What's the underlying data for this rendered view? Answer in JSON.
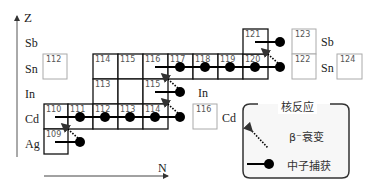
{
  "axes": {
    "z_label": "Z",
    "n_label": "N"
  },
  "elements_left": [
    {
      "symbol": "Sb",
      "row": "Sb"
    },
    {
      "symbol": "Sn",
      "row": "Sn"
    },
    {
      "symbol": "In",
      "row": "In"
    },
    {
      "symbol": "Cd",
      "row": "Cd"
    },
    {
      "symbol": "Ag",
      "row": "Ag"
    }
  ],
  "elements_right": {
    "sb": "Sb",
    "sn": "Sn",
    "in": "In",
    "cd": "Cd"
  },
  "nuclides": {
    "sn112": "112",
    "sn114": "114",
    "sn115": "115",
    "sn116": "116",
    "sn117": "117",
    "sn118": "118",
    "sn119": "119",
    "sn120": "120",
    "sb121": "121",
    "sb123": "123",
    "sn122": "122",
    "sn124": "124",
    "in113": "113",
    "in115": "115",
    "cd110": "110",
    "cd111": "111",
    "cd112": "112",
    "cd113": "113",
    "cd114": "114",
    "cd116": "116",
    "ag109": "109"
  },
  "legend": {
    "title": "核反应",
    "beta_decay": "β⁻衰变",
    "neutron_capture": "中子捕获"
  },
  "colors": {
    "s_process_box": "#111111",
    "other_box": "#aaaaaa",
    "marker": "#000000",
    "legend_border": "#333333",
    "legend_bg": "#f7f7f7"
  }
}
